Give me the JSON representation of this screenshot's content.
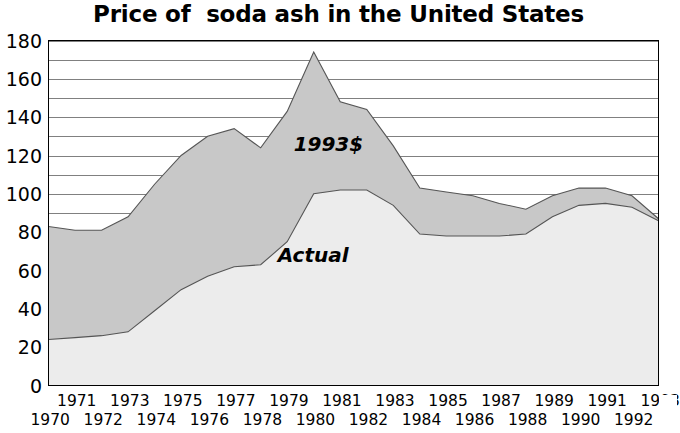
{
  "chart": {
    "title": "Price of  soda ash in the United States",
    "background_color": "#ffffff",
    "plot_border_color": "#000000",
    "gridline_color": "#808080"
  },
  "series_labels": {
    "deflated": "1993$",
    "actual": "Actual"
  },
  "y_axis": {
    "ticks": [
      "180",
      "160",
      "140",
      "120",
      "100",
      "80",
      "60",
      "40",
      "20",
      "0"
    ],
    "min": 0,
    "max": 180,
    "major_step": 20,
    "minor_step": 10
  },
  "x_axis": {
    "upper_row_labels": [
      "1971",
      "1973",
      "1975",
      "1977",
      "1979",
      "1981",
      "1983",
      "1985",
      "1987",
      "1989",
      "1991",
      "1993"
    ],
    "lower_row_labels": [
      "1970",
      "1972",
      "1974",
      "1976",
      "1978",
      "1980",
      "1982",
      "1984",
      "1986",
      "1988",
      "1990",
      "1992"
    ]
  },
  "chart_data": {
    "type": "area",
    "title": "Price of  soda ash in the United States",
    "xlabel": "",
    "ylabel": "",
    "ylim": [
      0,
      180
    ],
    "xlim": [
      1970,
      1993
    ],
    "grid": true,
    "legend_position": "inline-annotation",
    "stacked": false,
    "x": [
      1970,
      1971,
      1972,
      1973,
      1974,
      1975,
      1976,
      1977,
      1978,
      1979,
      1980,
      1981,
      1982,
      1983,
      1984,
      1985,
      1986,
      1987,
      1988,
      1989,
      1990,
      1991,
      1992,
      1993
    ],
    "series": [
      {
        "name": "1993$",
        "fill_color": "#c8c8c8",
        "line_color": "#555555",
        "values": [
          83,
          81,
          81,
          88,
          105,
          120,
          130,
          134,
          124,
          143,
          174,
          148,
          144,
          125,
          103,
          101,
          99,
          95,
          92,
          99,
          103,
          103,
          99,
          87
        ]
      },
      {
        "name": "Actual",
        "fill_color": "#ececec",
        "line_color": "#555555",
        "values": [
          24,
          25,
          26,
          28,
          39,
          50,
          57,
          62,
          63,
          75,
          100,
          102,
          102,
          94,
          79,
          78,
          78,
          78,
          79,
          88,
          94,
          95,
          93,
          86
        ]
      }
    ],
    "annotations": [
      {
        "text": "1993$",
        "x": 1980.6,
        "y": 126
      },
      {
        "text": "Actual",
        "x": 1980.0,
        "y": 68
      }
    ]
  }
}
